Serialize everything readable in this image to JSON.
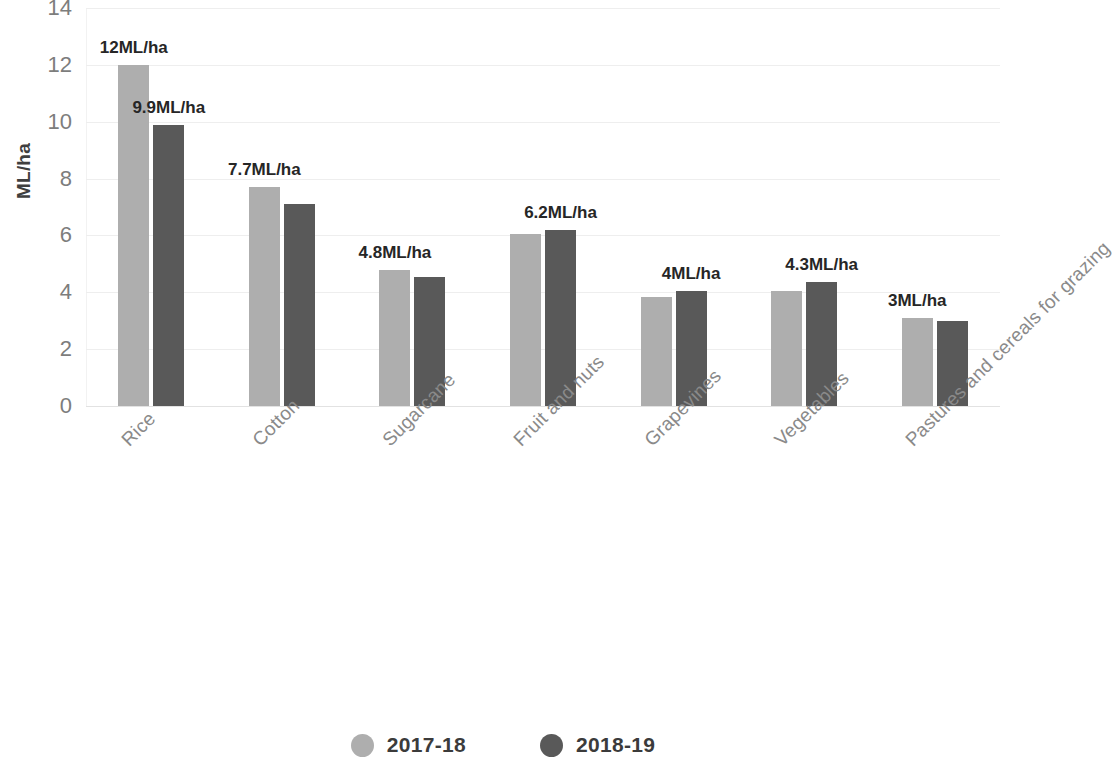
{
  "chart_data": {
    "type": "bar",
    "title": "",
    "subtitle": "",
    "xlabel": "",
    "ylabel": "ML/ha",
    "ylim": [
      0,
      14
    ],
    "yticks": [
      0,
      2,
      4,
      6,
      8,
      10,
      12,
      14
    ],
    "ytick_labels": [
      "0",
      "2",
      "4",
      "6",
      "8",
      "10",
      "12",
      "14"
    ],
    "grid": true,
    "grid_axis": "y",
    "legend_position": "bottom",
    "categories": [
      "Rice",
      "Cotton",
      "Sugarcane",
      "Fruit and nuts",
      "Grapevines",
      "Vegetables",
      "Pastures and cereals for grazing"
    ],
    "series": [
      {
        "name": "2017-18",
        "color": "#aeaeae",
        "values": [
          12.0,
          7.7,
          4.8,
          6.05,
          3.85,
          4.05,
          3.1
        ]
      },
      {
        "name": "2018-19",
        "color": "#595959",
        "values": [
          9.9,
          7.1,
          4.55,
          6.2,
          4.05,
          4.35,
          3.0
        ]
      }
    ],
    "annotations": [
      {
        "text": "12ML/ha",
        "category": "Rice",
        "series": "2017-18",
        "value": 12.0
      },
      {
        "text": "9.9ML/ha",
        "category": "Rice",
        "series": "2018-19",
        "value": 9.9
      },
      {
        "text": "7.7ML/ha",
        "category": "Cotton",
        "series": "2017-18",
        "value": 7.7
      },
      {
        "text": "4.8ML/ha",
        "category": "Sugarcane",
        "series": "2017-18",
        "value": 4.8
      },
      {
        "text": "6.2ML/ha",
        "category": "Fruit and nuts",
        "series": "2018-19",
        "value": 6.2
      },
      {
        "text": "4ML/ha",
        "category": "Grapevines",
        "series": "2018-19",
        "value": 4.05
      },
      {
        "text": "4.3ML/ha",
        "category": "Vegetables",
        "series": "2018-19",
        "value": 4.35
      },
      {
        "text": "3ML/ha",
        "category": "Pastures and cereals for grazing",
        "series": "2017-18",
        "value": 3.1
      }
    ]
  },
  "axis": {
    "y_title": "ML/ha",
    "y_tick_labels": [
      "14",
      "12",
      "10",
      "8",
      "6",
      "4",
      "2",
      "0"
    ]
  },
  "legend": {
    "items": [
      {
        "label": "2017-18",
        "color": "#aeaeae"
      },
      {
        "label": "2018-19",
        "color": "#595959"
      }
    ]
  }
}
